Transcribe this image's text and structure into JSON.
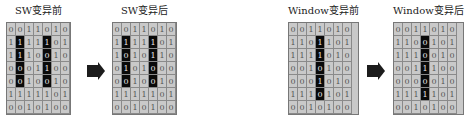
{
  "panels": [
    {
      "id": "sw-before",
      "caption": "SW变异前",
      "grid": [
        [
          "0",
          "0",
          "1",
          "1",
          "0",
          "1",
          "0"
        ],
        [
          "1",
          "1",
          "1",
          "1",
          "1",
          "0",
          "1"
        ],
        [
          "1",
          "1",
          "1",
          "0",
          "0",
          "1",
          "0"
        ],
        [
          "0",
          "0",
          "0",
          "1",
          "1",
          "0",
          "0"
        ],
        [
          "0",
          "0",
          "1",
          "0",
          "0",
          "1",
          "0"
        ],
        [
          "1",
          "1",
          "1",
          "1",
          "1",
          "0",
          "1"
        ],
        [
          "0",
          "0",
          "1",
          "0",
          "1",
          "0",
          "0"
        ]
      ],
      "highlight_columns": [
        1,
        4
      ],
      "highlight_rows": [
        1,
        2,
        3,
        4
      ]
    },
    {
      "id": "sw-after",
      "caption": "SW变异后",
      "grid": [
        [
          "0",
          "0",
          "1",
          "1",
          "0",
          "1",
          "0"
        ],
        [
          "1",
          "1",
          "1",
          "1",
          "1",
          "0",
          "1"
        ],
        [
          "1",
          "0",
          "1",
          "0",
          "1",
          "1",
          "0"
        ],
        [
          "0",
          "1",
          "0",
          "1",
          "0",
          "0",
          "0"
        ],
        [
          "0",
          "0",
          "1",
          "0",
          "0",
          "1",
          "0"
        ],
        [
          "1",
          "1",
          "1",
          "1",
          "1",
          "0",
          "1"
        ],
        [
          "0",
          "0",
          "1",
          "0",
          "1",
          "0",
          "0"
        ]
      ],
      "highlight_columns": [
        1,
        4
      ],
      "highlight_rows": [
        1,
        2,
        3,
        4
      ]
    },
    {
      "id": "window-before",
      "caption": "Window变异前",
      "grid": [
        [
          "0",
          "0",
          "1",
          "1",
          "0",
          "1",
          "0"
        ],
        [
          "1",
          "1",
          "0",
          "1",
          "1",
          "0",
          "1"
        ],
        [
          "1",
          "1",
          "1",
          "1",
          "0",
          "1",
          "0"
        ],
        [
          "0",
          "0",
          "1",
          "0",
          "1",
          "0",
          "0"
        ],
        [
          "0",
          "0",
          "0",
          "1",
          "0",
          "1",
          "0"
        ],
        [
          "1",
          "1",
          "1",
          "0",
          "1",
          "0",
          "1"
        ],
        [
          "0",
          "0",
          "1",
          "0",
          "1",
          "0",
          "0"
        ]
      ],
      "highlight_columns": [
        3
      ],
      "highlight_rows": [
        1,
        2,
        3,
        4,
        5
      ]
    },
    {
      "id": "window-after",
      "caption": "Window变异后",
      "grid": [
        [
          "0",
          "0",
          "1",
          "1",
          "0",
          "1",
          "0"
        ],
        [
          "1",
          "1",
          "0",
          "0",
          "1",
          "0",
          "1"
        ],
        [
          "1",
          "1",
          "1",
          "0",
          "0",
          "1",
          "0"
        ],
        [
          "0",
          "0",
          "1",
          "1",
          "1",
          "0",
          "0"
        ],
        [
          "0",
          "0",
          "0",
          "0",
          "0",
          "1",
          "0"
        ],
        [
          "1",
          "1",
          "1",
          "1",
          "1",
          "0",
          "1"
        ],
        [
          "0",
          "0",
          "1",
          "0",
          "1",
          "0",
          "0"
        ]
      ],
      "highlight_columns": [
        3
      ],
      "highlight_rows": [
        1,
        2,
        3,
        4,
        5
      ]
    }
  ],
  "arrows": [
    {
      "from": "sw-before",
      "to": "sw-after",
      "icon": "right-arrow-icon"
    },
    {
      "from": "window-before",
      "to": "window-after",
      "icon": "right-arrow-icon"
    }
  ],
  "colors": {
    "cell_bg": "#c9c9c9",
    "highlight_bg": "#0a0a0a",
    "arrow": "#1c1c1c"
  }
}
